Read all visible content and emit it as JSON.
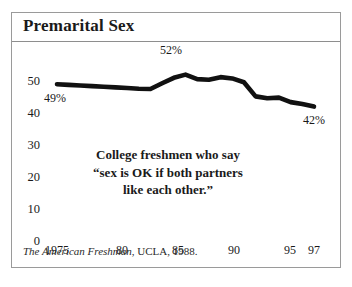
{
  "figure": {
    "title": "Premarital Sex",
    "source_italic": "The American Freshman",
    "source_rest": ", UCLA, 1988."
  },
  "annotation": {
    "line1": "College freshmen who say",
    "line2": "“sex is OK if both partners",
    "line3": "like each other.”"
  },
  "callouts": {
    "start": "49%",
    "peak": "52%",
    "end": "42%"
  },
  "colors": {
    "line": "#111111",
    "frame": "#9a9a9a",
    "rule": "#8e8e8e",
    "text": "#1a1a1a",
    "background": "#ffffff"
  },
  "chart_data": {
    "type": "line",
    "title": "Premarital Sex",
    "xlabel": "",
    "ylabel": "",
    "ylim": [
      0,
      55
    ],
    "xlim": [
      1975,
      1997
    ],
    "grid": false,
    "legend": null,
    "yticks": [
      0,
      10,
      20,
      30,
      40,
      50
    ],
    "ytick_labels": [
      "0",
      "10",
      "20",
      "30",
      "40",
      "50"
    ],
    "xticks": [
      1975,
      1980,
      1985,
      1990,
      1995,
      1997
    ],
    "xtick_labels": [
      "1975",
      "80",
      "85",
      "90",
      "95",
      "97"
    ],
    "series": [
      {
        "name": "College freshmen who say sex is OK if both partners like each other",
        "units": "percent",
        "x": [
          1975,
          1976,
          1977,
          1978,
          1979,
          1980,
          1981,
          1982,
          1983,
          1984,
          1985,
          1986,
          1987,
          1988,
          1989,
          1990,
          1991,
          1992,
          1993,
          1994,
          1995,
          1996,
          1997
        ],
        "values": [
          49.0,
          48.8,
          48.6,
          48.4,
          48.2,
          48.0,
          47.8,
          47.6,
          47.5,
          49.3,
          51.0,
          52.0,
          50.6,
          50.4,
          51.2,
          50.8,
          49.6,
          45.2,
          44.6,
          44.8,
          43.4,
          42.8,
          42.0
        ]
      }
    ],
    "annotations": [
      {
        "label": "49%",
        "x": 1975,
        "y": 49.0
      },
      {
        "label": "52%",
        "x": 1986,
        "y": 52.0
      },
      {
        "label": "42%",
        "x": 1997,
        "y": 42.0
      }
    ],
    "source": "The American Freshman, UCLA, 1988."
  }
}
